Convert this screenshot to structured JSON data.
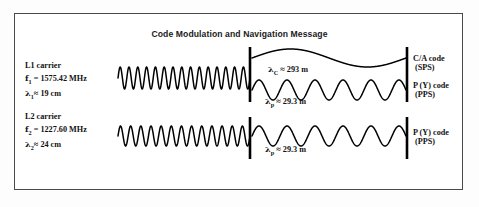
{
  "figure": {
    "title": "Code Modulation and Navigation Message",
    "border_color": "#4a4a4a",
    "stroke_color": "#000000",
    "background": "#ffffff"
  },
  "carriers": {
    "l1": {
      "name": "L1 carrier",
      "frequency": "f1 = 1575.42 MHz",
      "wavelength": "λ1≈ 19 cm",
      "freq_symbol": "f",
      "freq_sub": "1",
      "freq_value": "= 1575.42 MHz",
      "lam_symbol": "λ",
      "lam_sub": "1",
      "lam_value": "≈ 19 cm"
    },
    "l2": {
      "name": "L2 carrier",
      "frequency": "f2 = 1227.60 MHz",
      "wavelength": "λ2≈ 24 cm",
      "freq_symbol": "f",
      "freq_sub": "2",
      "freq_value": "= 1227.60 MHz",
      "lam_symbol": "λ",
      "lam_sub": "2",
      "lam_value": "≈ 24 cm"
    }
  },
  "codes": {
    "ca": {
      "line1": "C/A code",
      "line2": "(SPS)"
    },
    "py_l1": {
      "line1": "P (Y) code",
      "line2": "(PPS)"
    },
    "py_l2": {
      "line1": "P (Y) code",
      "line2": "(PPS)"
    }
  },
  "annotations": {
    "lambda_c": {
      "symbol": "λ",
      "sub": "C",
      "value": "≈ 293 m",
      "full": "λC ≈ 293 m"
    },
    "lambda_p_l1": {
      "symbol": "λ",
      "sub": "p",
      "value": "≈ 29.3 m",
      "full": "λp ≈ 29.3 m"
    },
    "lambda_p_l2": {
      "symbol": "λ",
      "sub": "p",
      "value": "≈ 29.3 m",
      "full": "λp ≈ 29.3 m"
    }
  },
  "chart_data": {
    "type": "line",
    "title": "Code Modulation and Navigation Message",
    "xlabel": "",
    "ylabel": "",
    "grid": false,
    "legend_position": "right",
    "series": [
      {
        "name": "L1 carrier",
        "waveform": "sine",
        "cycles": 15,
        "amplitude_px": 11,
        "x_start_px": 118,
        "x_end_px": 250,
        "baseline_y_px": 78,
        "label": "L1 carrier",
        "frequency_mhz": 1575.42,
        "wavelength_cm": 19
      },
      {
        "name": "C/A code (SPS)",
        "waveform": "sine",
        "cycles": 1,
        "amplitude_px": 9,
        "x_start_px": 252,
        "x_end_px": 406,
        "baseline_y_px": 58,
        "label": "C/A code",
        "wavelength_m": 293
      },
      {
        "name": "P (Y) code on L1 (PPS)",
        "waveform": "sine",
        "cycles": 5.5,
        "amplitude_px": 10,
        "x_start_px": 252,
        "x_end_px": 406,
        "baseline_y_px": 90,
        "label": "P (Y) code",
        "wavelength_m": 29.3
      },
      {
        "name": "L2 carrier",
        "waveform": "sine",
        "cycles": 13,
        "amplitude_px": 10,
        "x_start_px": 118,
        "x_end_px": 250,
        "baseline_y_px": 136,
        "label": "L2 carrier",
        "frequency_mhz": 1227.6,
        "wavelength_cm": 24
      },
      {
        "name": "P (Y) code on L2 (PPS)",
        "waveform": "sine",
        "cycles": 5.5,
        "amplitude_px": 10,
        "x_start_px": 252,
        "x_end_px": 406,
        "baseline_y_px": 136,
        "label": "P (Y) code",
        "wavelength_m": 29.3
      }
    ],
    "markers": [
      {
        "name": "divider-bar-l1",
        "x_px": 250,
        "y_top_px": 47,
        "y_bottom_px": 102
      },
      {
        "name": "divider-bar-l2",
        "x_px": 250,
        "y_top_px": 117,
        "y_bottom_px": 159
      },
      {
        "name": "end-bar-l1",
        "x_px": 407,
        "y_top_px": 47,
        "y_bottom_px": 102
      },
      {
        "name": "end-bar-l2",
        "x_px": 407,
        "y_top_px": 117,
        "y_bottom_px": 159
      }
    ]
  }
}
